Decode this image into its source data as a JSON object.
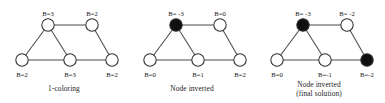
{
  "figure": {
    "title": "",
    "panel_width": 128,
    "panel_height": 103
  },
  "geometry": {
    "nodes": {
      "top_left": {
        "cx": 48,
        "cy": 25
      },
      "top_right": {
        "cx": 92,
        "cy": 25
      },
      "bottom_left": {
        "cx": 22,
        "cy": 60
      },
      "bottom_middle": {
        "cx": 70,
        "cy": 60
      },
      "bottom_right": {
        "cx": 112,
        "cy": 60
      }
    },
    "radius": 6.2,
    "edges": [
      [
        "top_left",
        "top_right"
      ],
      [
        "top_left",
        "bottom_left"
      ],
      [
        "top_left",
        "bottom_middle"
      ],
      [
        "bottom_left",
        "bottom_middle"
      ],
      [
        "bottom_middle",
        "bottom_right"
      ],
      [
        "top_right",
        "bottom_right"
      ]
    ],
    "label_offsets": {
      "top": {
        "dx": 0,
        "dy": -9
      },
      "bottom": {
        "dx": 0,
        "dy": 17
      }
    }
  },
  "colors": {
    "node_open_fill": "#ffffff",
    "node_filled_fill": "#101010",
    "node_stroke": "#2e2e2e",
    "edge_stroke": "#4a4a4a",
    "text": "#141414",
    "background": "#ffffff"
  },
  "panels": [
    {
      "id": "panel-1-coloring",
      "caption_lines": [
        "1-coloring"
      ],
      "nodes": [
        {
          "key": "top_left",
          "label": "B=3",
          "state": "open",
          "label_pos": "top"
        },
        {
          "key": "top_right",
          "label": "B=2",
          "state": "open",
          "label_pos": "top"
        },
        {
          "key": "bottom_left",
          "label": "B=2",
          "state": "open",
          "label_pos": "bottom"
        },
        {
          "key": "bottom_middle",
          "label": "B=3",
          "state": "open",
          "label_pos": "bottom"
        },
        {
          "key": "bottom_right",
          "label": "B=2",
          "state": "open",
          "label_pos": "bottom"
        }
      ]
    },
    {
      "id": "panel-node-inverted",
      "caption_lines": [
        "Node inverted"
      ],
      "nodes": [
        {
          "key": "top_left",
          "label": "B= -3",
          "state": "filled",
          "label_pos": "top"
        },
        {
          "key": "top_right",
          "label": "B=0",
          "state": "open",
          "label_pos": "top"
        },
        {
          "key": "bottom_left",
          "label": "B=0",
          "state": "open",
          "label_pos": "bottom"
        },
        {
          "key": "bottom_middle",
          "label": "B=1",
          "state": "open",
          "label_pos": "bottom"
        },
        {
          "key": "bottom_right",
          "label": "B=2",
          "state": "open",
          "label_pos": "bottom"
        }
      ]
    },
    {
      "id": "panel-node-inverted-final",
      "caption_lines": [
        "Node inverted",
        "(final solution)"
      ],
      "nodes": [
        {
          "key": "top_left",
          "label": "B= -3",
          "state": "filled",
          "label_pos": "top"
        },
        {
          "key": "top_right",
          "label": "B= -2",
          "state": "open",
          "label_pos": "top"
        },
        {
          "key": "bottom_left",
          "label": "B=0",
          "state": "open",
          "label_pos": "bottom"
        },
        {
          "key": "bottom_middle",
          "label": "B=-1",
          "state": "open",
          "label_pos": "bottom"
        },
        {
          "key": "bottom_right",
          "label": "B=-2",
          "state": "filled",
          "label_pos": "bottom"
        }
      ]
    }
  ]
}
